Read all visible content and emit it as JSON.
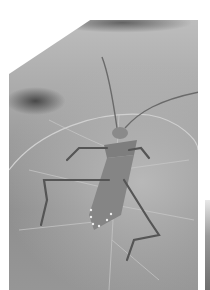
{
  "image": {
    "subject": "leaf-footed bug on a leaf",
    "style": "grayscale photograph"
  }
}
